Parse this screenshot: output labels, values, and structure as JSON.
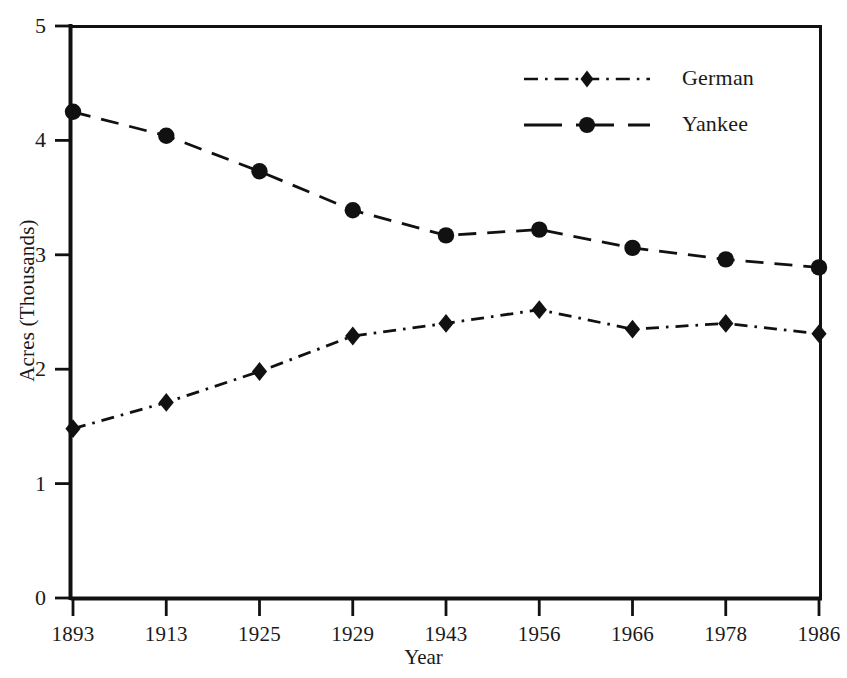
{
  "chart_data": {
    "type": "line",
    "title": "",
    "xlabel": "Year",
    "ylabel": "Acres (Thousands)",
    "categories": [
      "1893",
      "1913",
      "1925",
      "1929",
      "1943",
      "1956",
      "1966",
      "1978",
      "1986"
    ],
    "ylim": [
      0,
      5
    ],
    "yticks": [
      0,
      1,
      2,
      3,
      4,
      5
    ],
    "ytick_labels": [
      "0",
      "1",
      "2",
      "3",
      "4",
      "5"
    ],
    "grid": false,
    "legend_position": "top-right",
    "series": [
      {
        "name": "German",
        "marker": "diamond",
        "linestyle": "dash-dot",
        "color": "#111111",
        "values": [
          1.48,
          1.71,
          1.98,
          2.29,
          2.4,
          2.52,
          2.35,
          2.4,
          2.31
        ]
      },
      {
        "name": "Yankee",
        "marker": "circle",
        "linestyle": "dashed",
        "color": "#111111",
        "values": [
          4.25,
          4.04,
          3.73,
          3.39,
          3.17,
          3.22,
          3.06,
          2.96,
          2.89
        ]
      }
    ]
  },
  "axis": {
    "y_title": "Acres (Thousands)",
    "x_title": "Year"
  },
  "legend": {
    "items": [
      {
        "label": "German"
      },
      {
        "label": "Yankee"
      }
    ]
  }
}
